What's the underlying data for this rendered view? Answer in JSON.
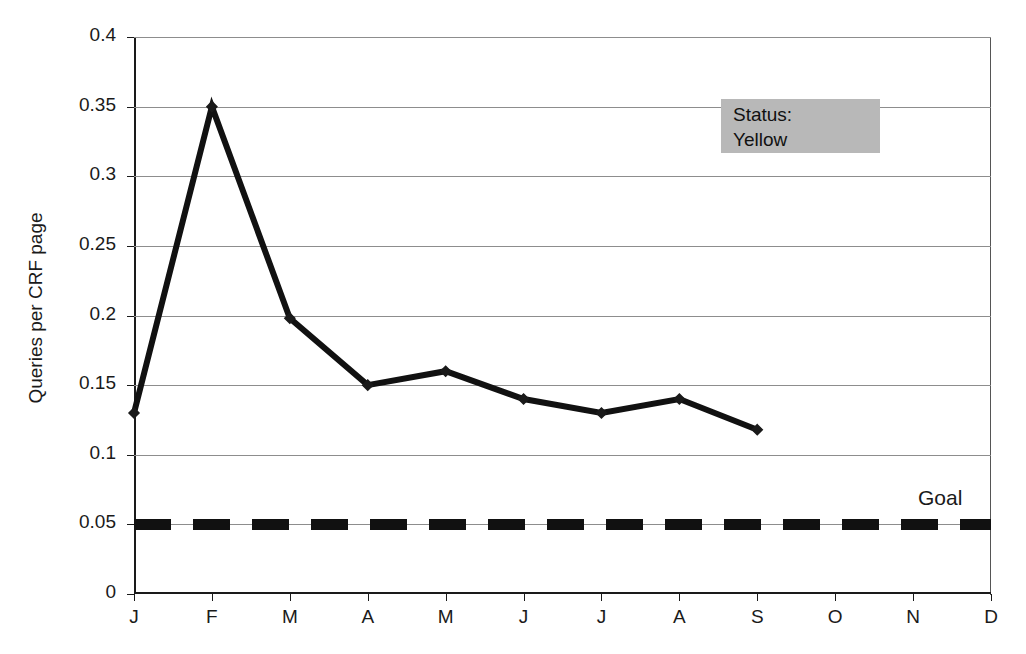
{
  "chart_data": {
    "type": "line",
    "title": "Queries per CRF page",
    "xlabel": "",
    "ylabel": "Queries per CRF page",
    "categories": [
      "J",
      "F",
      "M",
      "A",
      "M",
      "J",
      "J",
      "A",
      "S",
      "O",
      "N",
      "D"
    ],
    "series": [
      {
        "name": "Queries per CRF page",
        "values": [
          0.13,
          0.35,
          0.198,
          0.15,
          0.16,
          0.14,
          0.13,
          0.14,
          0.118,
          null,
          null,
          null
        ],
        "style": "solid-thick-with-diamond-markers",
        "color": "#111111"
      },
      {
        "name": "Goal",
        "values": [
          0.05,
          0.05,
          0.05,
          0.05,
          0.05,
          0.05,
          0.05,
          0.05,
          0.05,
          0.05,
          0.05,
          0.05
        ],
        "style": "dashed-thick",
        "color": "#111111"
      }
    ],
    "ylim": [
      0,
      0.4
    ],
    "yticks": [
      "0",
      "0.05",
      "0.1",
      "0.15",
      "0.2",
      "0.25",
      "0.3",
      "0.35",
      "0.4"
    ],
    "ytick_values": [
      0,
      0.05,
      0.1,
      0.15,
      0.2,
      0.25,
      0.3,
      0.35,
      0.4
    ],
    "grid": true,
    "legend": "none",
    "annotations": [
      {
        "name": "status",
        "line1": "Status:",
        "line2": "Yellow",
        "background": "#b8b8b8"
      },
      {
        "name": "goal",
        "text": "Goal"
      }
    ]
  },
  "axes": {
    "y_title": "Queries per CRF page"
  },
  "status_box": {
    "line1": "Status:",
    "line2": "Yellow"
  },
  "goal": {
    "label": "Goal"
  }
}
